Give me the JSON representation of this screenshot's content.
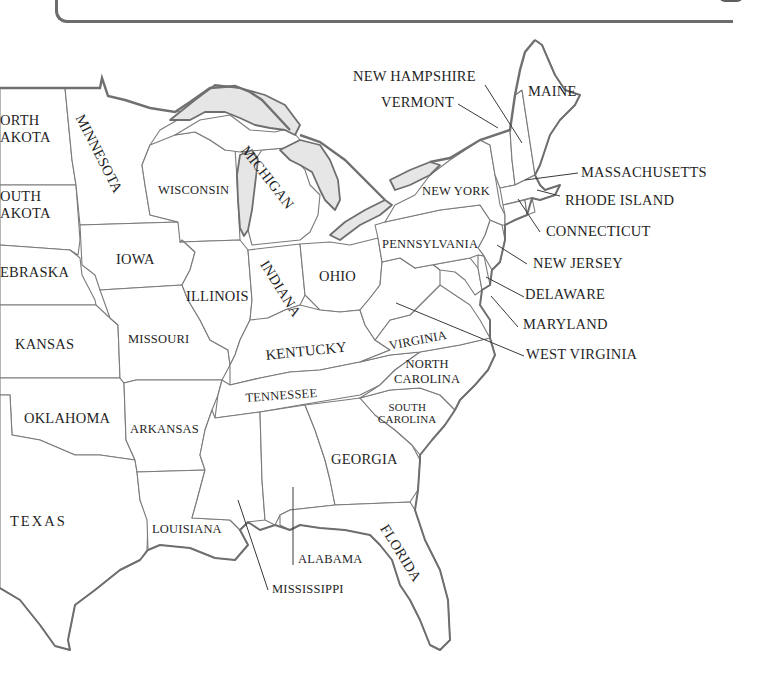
{
  "map": {
    "title": "Eastern United States",
    "colors": {
      "land": "#ffffff",
      "lakes": "#e6e6e6",
      "borders": "#7a7a7a",
      "text": "#1f1f1f",
      "panel_border": "#6d6d6d"
    },
    "states": {
      "north_dakota": "ORTH\nAKOTA",
      "south_dakota": "OUTH\nAKOTA",
      "nebraska": "EBRASKA",
      "kansas": "KANSAS",
      "oklahoma": "OKLAHOMA",
      "texas": "TEXAS",
      "minnesota": "MINNESOTA",
      "iowa": "IOWA",
      "missouri": "MISSOURI",
      "arkansas": "ARKANSAS",
      "louisiana": "LOUISIANA",
      "wisconsin": "WISCONSIN",
      "illinois": "ILLINOIS",
      "michigan": "MICHIGAN",
      "indiana": "INDIANA",
      "ohio": "OHIO",
      "kentucky": "KENTUCKY",
      "tennessee": "TENNESSEE",
      "mississippi": "MISSISSIPPI",
      "alabama": "ALABAMA",
      "georgia": "GEORGIA",
      "florida": "FLORIDA",
      "south_carolina": "SOUTH\nCAROLINA",
      "north_carolina": "NORTH\nCAROLINA",
      "virginia": "VIRGINIA",
      "west_virginia": "WEST VIRGINIA",
      "maryland": "MARYLAND",
      "delaware": "DELAWARE",
      "new_jersey": "NEW JERSEY",
      "pennsylvania": "PENNSYLVANIA",
      "new_york": "NEW YORK",
      "connecticut": "CONNECTICUT",
      "rhode_island": "RHODE ISLAND",
      "massachusetts": "MASSACHUSETTS",
      "vermont": "VERMONT",
      "new_hampshire": "NEW HAMPSHIRE",
      "maine": "MAINE"
    }
  }
}
